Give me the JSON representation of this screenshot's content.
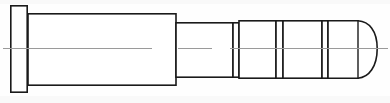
{
  "document": {
    "title": "Stepped Shaft Side Elevation",
    "drawing_type": "engineering-line-drawing",
    "view": "side elevation / longitudinal section outline",
    "canvas": {
      "width": 390,
      "height": 103
    },
    "background_color": "#fefefe",
    "line_color": "#1a1a1a",
    "centerline_color": "#9a9a9a",
    "fill_color": "#ffffff"
  },
  "part": {
    "name": "stepped-shaft-with-flange-and-domed-nose",
    "orientation": "horizontal, axis left-to-right",
    "axis_y": 48.5,
    "overall_length_px": 368,
    "left_edge_px": 10,
    "right_edge_px": 378
  },
  "features": [
    {
      "id": "flange",
      "label": "End flange",
      "shape": "rectangle",
      "x_start": 10,
      "x_end": 28,
      "top": 5,
      "bottom": 93,
      "height_px": 88
    },
    {
      "id": "main-body",
      "label": "Main cylindrical body",
      "shape": "rectangle",
      "x_start": 28,
      "x_end": 176,
      "top": 13,
      "bottom": 86,
      "height_px": 73
    },
    {
      "id": "shoulder-1",
      "label": "First reduced diameter section",
      "shape": "rectangle",
      "x_start": 176,
      "x_end": 233,
      "top": 22,
      "bottom": 78,
      "height_px": 56
    },
    {
      "id": "groove-1",
      "label": "Relief groove 1",
      "shape": "narrow-gap",
      "x_start": 233,
      "x_end": 239,
      "top": 22,
      "bottom": 78
    },
    {
      "id": "shoulder-2",
      "label": "Second collar section",
      "shape": "rectangle",
      "x_start": 239,
      "x_end": 276,
      "top": 20,
      "bottom": 79,
      "height_px": 59
    },
    {
      "id": "groove-2",
      "label": "Relief groove 2",
      "shape": "narrow-gap",
      "x_start": 276,
      "x_end": 283,
      "top": 20,
      "bottom": 79
    },
    {
      "id": "shoulder-3",
      "label": "Third collar section",
      "shape": "rectangle",
      "x_start": 283,
      "x_end": 322,
      "top": 20,
      "bottom": 79,
      "height_px": 59
    },
    {
      "id": "groove-3",
      "label": "Relief groove 3",
      "shape": "narrow-gap",
      "x_start": 322,
      "x_end": 328,
      "top": 20,
      "bottom": 79
    },
    {
      "id": "nose-barrel",
      "label": "Nose barrel before dome",
      "shape": "rectangle",
      "x_start": 328,
      "x_end": 358,
      "top": 20,
      "bottom": 79,
      "height_px": 59
    },
    {
      "id": "nose-dome",
      "label": "Domed rounded tip",
      "shape": "dome",
      "x_start": 358,
      "x_end": 378,
      "top": 22,
      "bottom": 77,
      "radius_px": 20
    }
  ],
  "centerline": {
    "label": "Axis centerline",
    "y": 48.5,
    "style": "thin gray broken line",
    "segments": [
      {
        "x1": 3,
        "x2": 152
      },
      {
        "x1": 178,
        "x2": 212
      },
      {
        "x1": 230,
        "x2": 388
      }
    ]
  }
}
